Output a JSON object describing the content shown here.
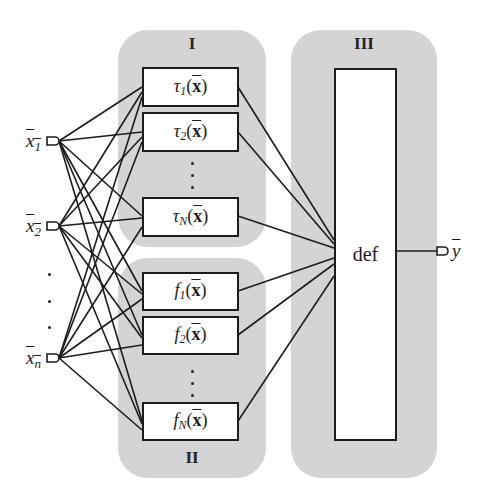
{
  "groups": {
    "I": {
      "label": "I"
    },
    "II": {
      "label": "II"
    },
    "III": {
      "label": "III"
    }
  },
  "inputs": [
    {
      "name": "x",
      "sub": "1"
    },
    {
      "name": "x",
      "sub": "2"
    },
    {
      "name": "x",
      "sub": "n"
    }
  ],
  "tau_boxes": [
    {
      "name": "τ",
      "sub": "1",
      "arg": "x"
    },
    {
      "name": "τ",
      "sub": "2",
      "arg": "x"
    },
    {
      "name": "τ",
      "sub": "N",
      "arg": "x"
    }
  ],
  "f_boxes": [
    {
      "name": "f",
      "sub": "1",
      "arg": "x"
    },
    {
      "name": "f",
      "sub": "2",
      "arg": "x"
    },
    {
      "name": "f",
      "sub": "N",
      "arg": "x"
    }
  ],
  "def_box": {
    "label": "def"
  },
  "output": {
    "name": "y"
  },
  "colors": {
    "group_fill": "#d4d4d4",
    "stroke": "#1c1c1c"
  }
}
